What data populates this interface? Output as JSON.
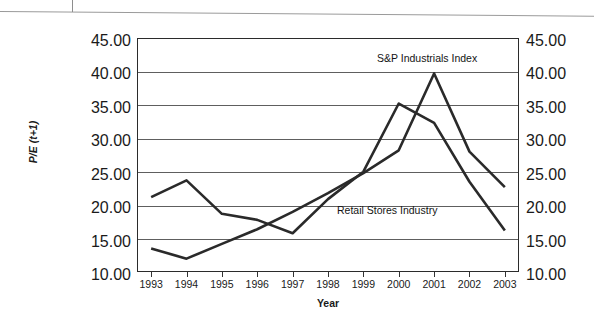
{
  "figure": {
    "x_axis_title": "Year",
    "y_axis_title": "P/E (t+1)",
    "y_axis_title_parts": {
      "main": "P/E",
      "sub": "(t+1)"
    }
  },
  "annotations": {
    "sp_label": "S&P Industrials Index",
    "retail_label": "Retail Stores Industry"
  },
  "axis": {
    "y_ticks": [
      "45.00",
      "40.00",
      "35.00",
      "30.00",
      "25.00",
      "20.00",
      "15.00",
      "10.00"
    ],
    "y_ticks_right": [
      "45.00",
      "40.00",
      "35.00",
      "30.00",
      "25.00",
      "20.00",
      "15.00",
      "10.00"
    ],
    "x_ticks": [
      "1993",
      "1994",
      "1995",
      "1996",
      "1997",
      "1998",
      "1999",
      "2000",
      "2001",
      "2002",
      "2003"
    ]
  },
  "colors": {
    "line": "#2a2a2a",
    "grid": "#5e5e5e",
    "frame": "#2b2b2b",
    "background": "#ffffff"
  },
  "chart_data": {
    "type": "line",
    "title": "",
    "xlabel": "Year",
    "ylabel": "P/E (t+1)",
    "xlim": [
      1992.6,
      2003.4
    ],
    "ylim": [
      10.0,
      45.0
    ],
    "ytick_values": [
      10.0,
      15.0,
      20.0,
      25.0,
      30.0,
      35.0,
      40.0,
      45.0
    ],
    "grid": "horizontal",
    "legend": "inline-annotations",
    "x": [
      1993,
      1994,
      1995,
      1996,
      1997,
      1998,
      1999,
      2000,
      2001,
      2002,
      2003
    ],
    "series": [
      {
        "name": "S&P Industrials Index",
        "values": [
          13.5,
          12.0,
          14.2,
          16.4,
          19.0,
          21.8,
          24.8,
          28.2,
          39.7,
          28.0,
          22.7
        ]
      },
      {
        "name": "Retail Stores Industry",
        "values": [
          21.2,
          23.7,
          18.7,
          17.8,
          15.8,
          20.9,
          25.0,
          35.2,
          32.3,
          23.5,
          16.2
        ]
      }
    ]
  }
}
